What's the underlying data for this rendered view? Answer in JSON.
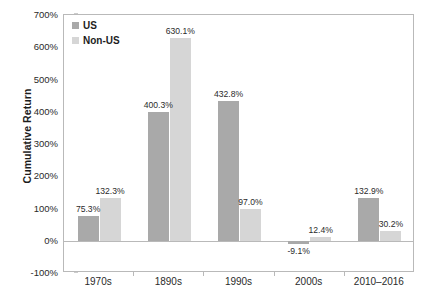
{
  "chart_data": {
    "type": "bar",
    "title": "",
    "subtitle": "",
    "xlabel": "",
    "ylabel": "Cumulative Return",
    "ylim": [
      -100,
      700
    ],
    "ytick_values": [
      700,
      600,
      500,
      400,
      300,
      200,
      100,
      0,
      -100
    ],
    "ytick_labels": [
      "700%",
      "600%",
      "500%",
      "400%",
      "300%",
      "200%",
      "100%",
      "0%",
      "-100%"
    ],
    "grid": false,
    "legend_position": "top-left-inside",
    "categories": [
      "1970s",
      "1890s",
      "1990s",
      "2000s",
      "2010–2016"
    ],
    "series": [
      {
        "name": "US",
        "color": "#a9a9a9",
        "values": [
          75.3,
          400.3,
          432.8,
          -9.1,
          132.9
        ],
        "labels": [
          "75.3%",
          "400.3%",
          "432.8%",
          "-9.1%",
          "132.9%"
        ]
      },
      {
        "name": "Non-US",
        "color": "#d6d6d6",
        "values": [
          132.3,
          630.1,
          97.0,
          12.4,
          30.2
        ],
        "labels": [
          "132.3%",
          "630.1%",
          "97.0%",
          "12.4%",
          "30.2%"
        ]
      }
    ]
  },
  "legend": {
    "entries": [
      {
        "label": "US",
        "color": "#a9a9a9"
      },
      {
        "label": "Non-US",
        "color": "#d6d6d6"
      }
    ]
  },
  "axes": {
    "y_title": "Cumulative Return"
  }
}
